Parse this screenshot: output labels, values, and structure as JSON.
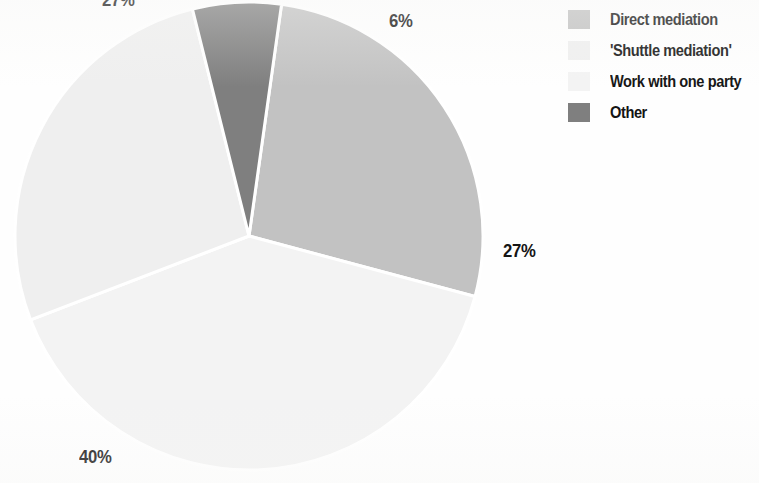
{
  "chart_data": {
    "type": "pie",
    "title": "",
    "labels": [
      "Direct mediation",
      "'Shuttle mediation'",
      "Work with one party",
      "Other"
    ],
    "values": [
      27,
      27,
      40,
      6
    ],
    "value_suffix": "%",
    "data_labels": [
      "27%",
      "27%",
      "40%",
      "6%"
    ],
    "colors": [
      "#c2c2c2",
      "#efefef",
      "#f3f3f3",
      "#7f7f7f"
    ],
    "slice_separator_color": "#ffffff",
    "legend_position": "top-right",
    "start_angle_deg": 8,
    "direction": "clockwise",
    "center": {
      "x": 249,
      "y": 236
    },
    "radius": 234,
    "slices": [
      {
        "label": "Direct mediation",
        "value": 27,
        "data_label": "27%",
        "color": "#c2c2c2",
        "start_deg": 8,
        "end_deg": 105
      },
      {
        "label": "Work with one party",
        "value": 40,
        "data_label": "40%",
        "color": "#f3f3f3",
        "start_deg": 105,
        "end_deg": 249
      },
      {
        "label": "'Shuttle mediation'",
        "value": 27,
        "data_label": "27%",
        "color": "#efefef",
        "start_deg": 249,
        "end_deg": 346
      },
      {
        "label": "Other",
        "value": 6,
        "data_label": "6%",
        "color": "#7f7f7f",
        "start_deg": 346,
        "end_deg": 8
      }
    ]
  },
  "pie_labels": {
    "top": "6%",
    "right": "27%",
    "bottom_left": "40%",
    "top_left": "27%"
  },
  "legend": {
    "items": [
      {
        "label": "Direct mediation",
        "color": "#c2c2c2"
      },
      {
        "label": "'Shuttle mediation'",
        "color": "#efefef"
      },
      {
        "label": "Work with one party",
        "color": "#f3f3f3"
      },
      {
        "label": "Other",
        "color": "#7f7f7f"
      }
    ]
  }
}
